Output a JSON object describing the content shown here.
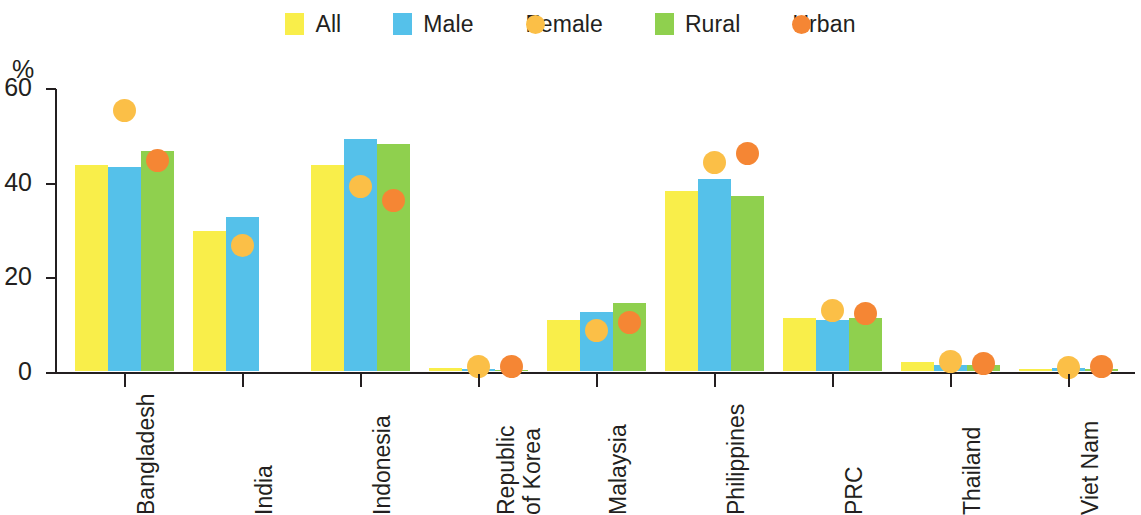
{
  "legend": {
    "items": [
      {
        "label": "All",
        "marker": "square",
        "color": "#F9EE4A",
        "name": "legend-item-all"
      },
      {
        "label": "Male",
        "marker": "square",
        "color": "#55C1EA",
        "name": "legend-item-male"
      },
      {
        "label": "Female",
        "marker": "circle",
        "color": "#FBBF47",
        "name": "legend-item-female"
      },
      {
        "label": "Rural",
        "marker": "square",
        "color": "#8FD04E",
        "name": "legend-item-rural"
      },
      {
        "label": "Urban",
        "marker": "circle",
        "color": "#F58634",
        "name": "legend-item-urban"
      }
    ]
  },
  "axis": {
    "y_unit": "%",
    "y_ticks": [
      "60",
      "40",
      "20",
      "0"
    ]
  },
  "chart_data": {
    "type": "bar",
    "title": "",
    "xlabel": "",
    "ylabel": "%",
    "ylim": [
      0,
      60
    ],
    "ytick_values": [
      0,
      20,
      40,
      60
    ],
    "grid": false,
    "legend_position": "top-center",
    "categories": [
      "Bangladesh",
      "India",
      "Indonesia",
      "Republic\nof Korea",
      "Malaysia",
      "Philippines",
      "PRC",
      "Thailand",
      "Viet Nam"
    ],
    "series": [
      {
        "name": "All",
        "marker": "bar",
        "color": "#F9EE4A",
        "values": [
          43.5,
          29.5,
          43.5,
          0.7,
          10.8,
          38.0,
          11.2,
          1.8,
          0.4
        ]
      },
      {
        "name": "Male",
        "marker": "bar",
        "color": "#55C1EA",
        "values": [
          43.0,
          32.5,
          49.0,
          0.5,
          12.5,
          40.5,
          10.8,
          1.2,
          0.6
        ]
      },
      {
        "name": "Female",
        "marker": "dot",
        "color": "#FBBF47",
        "values": [
          55.0,
          26.5,
          39.0,
          1.0,
          8.5,
          44.0,
          12.8,
          2.0,
          0.7
        ]
      },
      {
        "name": "Rural",
        "marker": "bar",
        "color": "#8FD04E",
        "values": [
          46.5,
          null,
          48.0,
          0.3,
          14.3,
          37.0,
          11.3,
          1.2,
          0.4
        ]
      },
      {
        "name": "Urban",
        "marker": "dot",
        "color": "#F58634",
        "values": [
          44.5,
          null,
          36.0,
          1.0,
          10.3,
          46.0,
          12.2,
          1.5,
          1.0
        ]
      }
    ]
  }
}
